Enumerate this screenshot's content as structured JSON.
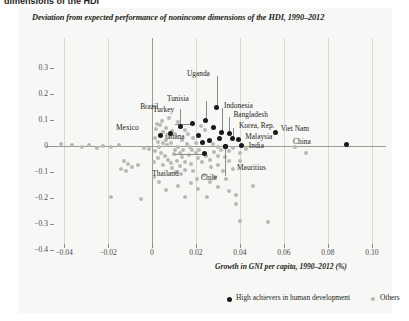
{
  "page": {
    "cut_headline": "dimensions of the HDI"
  },
  "chart_data": {
    "type": "scatter",
    "title": "Deviation from expected performance of nonincome dimensions of the HDI, 1990–2012",
    "xlabel": "Growth in GNI per capita, 1990–2012 (%)",
    "ylabel": "",
    "xlim": [
      -0.05,
      0.105
    ],
    "ylim": [
      -0.4,
      0.32
    ],
    "xticks": [
      "−0.04",
      "−0.02",
      "0",
      "0.02",
      "0.04",
      "0.06",
      "0.08",
      "0.10"
    ],
    "xtick_values": [
      -0.04,
      -0.02,
      0,
      0.02,
      0.04,
      0.06,
      0.08,
      0.1
    ],
    "yticks": [
      "0.3",
      "0.2",
      "0.1",
      "0",
      "−0.1",
      "−0.2",
      "−0.3",
      "−0.4"
    ],
    "ytick_values": [
      0.3,
      0.2,
      0.1,
      0,
      -0.1,
      -0.2,
      -0.3,
      -0.4
    ],
    "grid": "vertical-only",
    "legend_position": "bottom",
    "legend": [
      {
        "label": "High achievers in human development",
        "color": "#1a1a1a"
      },
      {
        "label": "Others",
        "color": "#b8b8b4"
      }
    ],
    "series": [
      {
        "name": "High achievers in human development",
        "color": "#1a1a1a",
        "points": [
          {
            "label": "Uganda",
            "x": 0.0295,
            "y": 0.15,
            "label_dx": -8,
            "label_dy": -33,
            "leader": true
          },
          {
            "label": "Tunisia",
            "x": 0.0245,
            "y": 0.098,
            "label_dx": -17,
            "label_dy": -22,
            "leader": true
          },
          {
            "label": "Turkey",
            "x": 0.0182,
            "y": 0.085,
            "label_dx": -17,
            "label_dy": -14,
            "leader": true
          },
          {
            "label": "Brazil",
            "x": 0.0128,
            "y": 0.075,
            "label_dx": -18,
            "label_dy": -20,
            "leader": true
          },
          {
            "label": "Mexico",
            "x": 0.0082,
            "y": 0.048,
            "label_dx": -32,
            "label_dy": -6,
            "leader": false
          },
          {
            "label": "Ghana",
            "x": 0.0038,
            "y": 0.04,
            "label_dx": 5,
            "label_dy": 1,
            "leader": false
          },
          {
            "label": "Indonesia",
            "x": 0.0318,
            "y": 0.052,
            "label_dx": 2,
            "label_dy": -26,
            "leader": true
          },
          {
            "label": "Bangladesh",
            "x": 0.0352,
            "y": 0.048,
            "label_dx": 4,
            "label_dy": -19,
            "leader": true
          },
          {
            "label": "Korea, Rep.",
            "x": 0.0368,
            "y": 0.03,
            "label_dx": 6,
            "label_dy": -12,
            "leader": true
          },
          {
            "label": "Malaysia",
            "x": 0.0392,
            "y": 0.025,
            "label_dx": 7,
            "label_dy": -3,
            "leader": false
          },
          {
            "label": "Viet Nam",
            "x": 0.0562,
            "y": 0.052,
            "label_dx": 5,
            "label_dy": -3,
            "leader": false
          },
          {
            "label": "India",
            "x": 0.0408,
            "y": 0.002,
            "label_dx": 7,
            "label_dy": 1,
            "leader": false
          },
          {
            "label": "China",
            "x": 0.0882,
            "y": 0.005,
            "label_dx": -31,
            "label_dy": -3,
            "leader": false
          },
          {
            "label": "Mauritius",
            "x": 0.0332,
            "y": 0.0,
            "label_dx": 12,
            "label_dy": 22,
            "leader": true
          },
          {
            "label": "Chile",
            "x": 0.0332,
            "y": 0.0,
            "label_dx": -2,
            "label_dy": 32,
            "leader": true
          },
          {
            "label": "Thailand",
            "x": 0.0238,
            "y": -0.03,
            "label_dx": -30,
            "label_dy": 20,
            "leader": true
          },
          {
            "label": "",
            "x": 0.0278,
            "y": 0.072,
            "label_dx": 0,
            "label_dy": 0,
            "leader": false
          },
          {
            "label": "",
            "x": 0.0308,
            "y": 0.03,
            "label_dx": 0,
            "label_dy": 0,
            "leader": false
          },
          {
            "label": "",
            "x": 0.0212,
            "y": 0.042,
            "label_dx": 0,
            "label_dy": 0,
            "leader": false
          },
          {
            "label": "",
            "x": 0.0262,
            "y": 0.022,
            "label_dx": 0,
            "label_dy": 0,
            "leader": false
          },
          {
            "label": "",
            "x": 0.0228,
            "y": 0.012,
            "label_dx": 0,
            "label_dy": 0,
            "leader": false
          }
        ]
      },
      {
        "name": "Others",
        "color": "#b8b8b4",
        "points": [
          [
            -0.0412,
            0.006
          ],
          [
            -0.0362,
            0.002
          ],
          [
            -0.0318,
            -0.004
          ],
          [
            -0.0285,
            0.004
          ],
          [
            -0.0248,
            -0.006
          ],
          [
            -0.0222,
            0.0
          ],
          [
            -0.0185,
            -0.002
          ],
          [
            -0.0152,
            0.004
          ],
          [
            -0.0128,
            -0.056
          ],
          [
            -0.0108,
            -0.068
          ],
          [
            -0.0092,
            -0.082
          ],
          [
            -0.0062,
            -0.072
          ],
          [
            -0.0142,
            -0.09
          ],
          [
            -0.0118,
            -0.098
          ],
          [
            -0.0035,
            -0.006
          ],
          [
            -0.0015,
            -0.01
          ],
          [
            -0.0052,
            -0.202
          ],
          [
            -0.0188,
            -0.196
          ],
          [
            0.0018,
            0.066
          ],
          [
            0.0038,
            0.082
          ],
          [
            0.0012,
            0.03
          ],
          [
            0.0028,
            0.016
          ],
          [
            0.0048,
            0.01
          ],
          [
            0.0062,
            0.022
          ],
          [
            0.0068,
            0.004
          ],
          [
            0.0032,
            -0.004
          ],
          [
            0.0015,
            -0.018
          ],
          [
            0.0042,
            -0.028
          ],
          [
            0.0058,
            -0.04
          ],
          [
            0.0072,
            -0.052
          ],
          [
            0.0025,
            -0.048
          ],
          [
            0.0008,
            -0.062
          ],
          [
            0.0052,
            -0.072
          ],
          [
            0.0085,
            -0.064
          ],
          [
            0.0098,
            -0.032
          ],
          [
            0.0105,
            -0.016
          ],
          [
            0.0118,
            -0.004
          ],
          [
            0.0128,
            -0.026
          ],
          [
            0.0142,
            -0.014
          ],
          [
            0.0135,
            -0.044
          ],
          [
            0.0112,
            -0.056
          ],
          [
            0.0092,
            -0.086
          ],
          [
            0.0125,
            -0.078
          ],
          [
            0.0152,
            -0.062
          ],
          [
            0.0168,
            -0.036
          ],
          [
            0.0182,
            -0.016
          ],
          [
            0.0198,
            -0.028
          ],
          [
            0.0215,
            -0.014
          ],
          [
            0.0208,
            -0.048
          ],
          [
            0.0178,
            -0.07
          ],
          [
            0.0152,
            -0.092
          ],
          [
            0.0132,
            -0.108
          ],
          [
            0.0108,
            -0.1
          ],
          [
            0.0188,
            -0.098
          ],
          [
            0.0228,
            -0.062
          ],
          [
            0.0245,
            -0.038
          ],
          [
            0.0262,
            -0.052
          ],
          [
            0.0282,
            -0.022
          ],
          [
            0.0298,
            -0.038
          ],
          [
            0.0312,
            -0.014
          ],
          [
            0.0268,
            -0.082
          ],
          [
            0.0238,
            -0.112
          ],
          [
            0.0205,
            -0.126
          ],
          [
            0.0178,
            -0.142
          ],
          [
            0.0302,
            -0.072
          ],
          [
            0.0332,
            -0.042
          ],
          [
            0.0352,
            -0.018
          ],
          [
            0.0368,
            -0.006
          ],
          [
            0.0348,
            -0.058
          ],
          [
            0.0322,
            -0.096
          ],
          [
            0.0288,
            -0.118
          ],
          [
            0.0262,
            -0.138
          ],
          [
            0.0402,
            -0.028
          ],
          [
            0.0425,
            -0.012
          ],
          [
            0.0398,
            -0.056
          ],
          [
            0.0368,
            -0.088
          ],
          [
            0.0338,
            -0.128
          ],
          [
            0.0092,
            0.058
          ],
          [
            0.0105,
            0.046
          ],
          [
            0.0062,
            0.068
          ],
          [
            0.0148,
            0.062
          ],
          [
            0.0165,
            0.048
          ],
          [
            0.0118,
            0.092
          ],
          [
            0.0045,
            0.098
          ],
          [
            0.0022,
            0.086
          ],
          [
            0.0078,
            0.108
          ],
          [
            0.0185,
            0.03
          ],
          [
            0.0202,
            0.012
          ],
          [
            0.0242,
            0.062
          ],
          [
            0.0222,
            0.078
          ],
          [
            0.0278,
            0.008
          ],
          [
            0.0298,
            -0.002
          ],
          [
            0.0158,
            0.008
          ],
          [
            0.0138,
            0.024
          ],
          [
            0.0172,
            -0.002
          ],
          [
            0.0088,
            0.012
          ],
          [
            0.0075,
            0.038
          ],
          [
            0.0052,
            0.052
          ],
          [
            0.0035,
            0.042
          ],
          [
            0.0152,
            -0.198
          ],
          [
            0.0252,
            -0.198
          ],
          [
            0.0382,
            -0.188
          ],
          [
            0.0382,
            -0.222
          ],
          [
            0.0398,
            -0.288
          ],
          [
            0.0528,
            -0.292
          ],
          [
            0.0652,
            -0.002
          ],
          [
            0.0702,
            -0.028
          ],
          [
            0.0458,
            -0.152
          ],
          [
            0.0208,
            -0.166
          ],
          [
            0.0118,
            -0.152
          ],
          [
            0.0062,
            -0.168
          ],
          [
            0.0298,
            -0.158
          ],
          [
            0.0348,
            -0.172
          ],
          [
            0.0032,
            -0.138
          ],
          [
            0.0008,
            -0.118
          ]
        ]
      }
    ]
  }
}
